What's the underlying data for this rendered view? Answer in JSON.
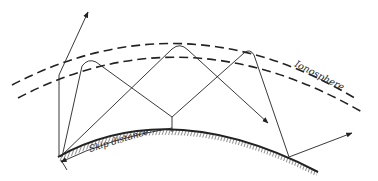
{
  "diagram": {
    "labels": {
      "ionosphere": "Ionosphere",
      "skip_distance": "Skip distance"
    },
    "colors": {
      "ink": "#222222",
      "background": "#ffffff"
    }
  }
}
